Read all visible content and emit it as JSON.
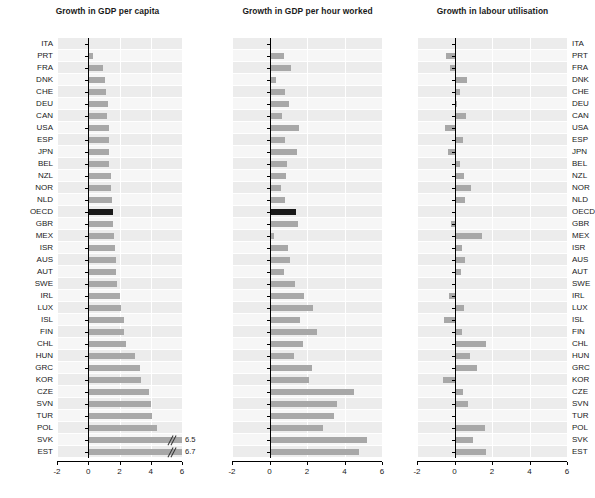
{
  "figure": {
    "width": 585,
    "height": 498,
    "bar_color": "#a8a8a8",
    "highlight_color": "#1a1a1a",
    "plot_bg": "#f2f2f2",
    "grid_color": "#ffffff",
    "highlight_category": "OECD"
  },
  "categories": [
    "ITA",
    "PRT",
    "FRA",
    "DNK",
    "CHE",
    "DEU",
    "CAN",
    "USA",
    "ESP",
    "JPN",
    "BEL",
    "NZL",
    "NOR",
    "NLD",
    "OECD",
    "GBR",
    "MEX",
    "ISR",
    "AUS",
    "AUT",
    "SWE",
    "IRL",
    "LUX",
    "ISL",
    "FIN",
    "CHL",
    "HUN",
    "GRC",
    "KOR",
    "CZE",
    "SVN",
    "TUR",
    "POL",
    "SVK",
    "EST"
  ],
  "chart_data": [
    {
      "type": "bar",
      "title": "Growth in GDP per capita",
      "orientation": "horizontal",
      "xlabel": "",
      "ylabel": "",
      "xlim": [
        -2,
        6
      ],
      "xticks": [
        -2,
        0,
        2,
        4,
        6
      ],
      "xtick_labels": [
        "-2",
        "0",
        "2",
        "4",
        "6"
      ],
      "grid": true,
      "legend": "none",
      "label_side": "left",
      "categories": [
        "ITA",
        "PRT",
        "FRA",
        "DNK",
        "CHE",
        "DEU",
        "CAN",
        "USA",
        "ESP",
        "JPN",
        "BEL",
        "NZL",
        "NOR",
        "NLD",
        "OECD",
        "GBR",
        "MEX",
        "ISR",
        "AUS",
        "AUT",
        "SWE",
        "IRL",
        "LUX",
        "ISL",
        "FIN",
        "CHL",
        "HUN",
        "GRC",
        "KOR",
        "CZE",
        "SVN",
        "TUR",
        "POL",
        "SVK",
        "EST"
      ],
      "values": [
        0.05,
        0.3,
        0.95,
        1.05,
        1.15,
        1.25,
        1.2,
        1.35,
        1.3,
        1.35,
        1.3,
        1.45,
        1.45,
        1.55,
        1.6,
        1.6,
        1.65,
        1.7,
        1.75,
        1.8,
        1.85,
        2.05,
        2.1,
        2.3,
        2.3,
        2.4,
        3.0,
        3.3,
        3.4,
        3.9,
        4.0,
        4.1,
        4.4,
        6.5,
        6.7
      ],
      "annotations": [
        {
          "category": "SVK",
          "label": "6.5",
          "clipped": true
        },
        {
          "category": "EST",
          "label": "6.7",
          "clipped": true
        }
      ]
    },
    {
      "type": "bar",
      "title": "Growth in GDP per hour worked",
      "orientation": "horizontal",
      "xlabel": "",
      "ylabel": "",
      "xlim": [
        -2,
        6
      ],
      "xticks": [
        -2,
        0,
        2,
        4,
        6
      ],
      "xtick_labels": [
        "-2",
        "0",
        "2",
        "4",
        "6"
      ],
      "grid": true,
      "legend": "none",
      "label_side": "none",
      "categories": [
        "ITA",
        "PRT",
        "FRA",
        "DNK",
        "CHE",
        "DEU",
        "CAN",
        "USA",
        "ESP",
        "JPN",
        "BEL",
        "NZL",
        "NOR",
        "NLD",
        "OECD",
        "GBR",
        "MEX",
        "ISR",
        "AUS",
        "AUT",
        "SWE",
        "IRL",
        "LUX",
        "ISL",
        "FIN",
        "CHL",
        "HUN",
        "GRC",
        "KOR",
        "CZE",
        "SVN",
        "TUR",
        "POL",
        "SVK",
        "EST"
      ],
      "values": [
        0.05,
        0.75,
        1.15,
        0.35,
        0.8,
        1.05,
        0.65,
        1.55,
        0.85,
        1.45,
        0.95,
        0.9,
        0.6,
        0.85,
        1.4,
        1.5,
        0.25,
        1.0,
        1.1,
        0.75,
        1.35,
        1.85,
        2.3,
        1.6,
        2.55,
        1.8,
        1.3,
        2.25,
        2.1,
        4.5,
        3.6,
        3.45,
        2.85,
        5.2,
        4.75
      ],
      "annotations": []
    },
    {
      "type": "bar",
      "title": "Growth in labour utilisation",
      "orientation": "horizontal",
      "xlabel": "",
      "ylabel": "",
      "xlim": [
        -2,
        6
      ],
      "xticks": [
        -2,
        0,
        2,
        4,
        6
      ],
      "xtick_labels": [
        "-2",
        "0",
        "2",
        "4",
        "6"
      ],
      "grid": true,
      "legend": "none",
      "label_side": "right",
      "categories": [
        "ITA",
        "PRT",
        "FRA",
        "DNK",
        "CHE",
        "DEU",
        "CAN",
        "USA",
        "ESP",
        "JPN",
        "BEL",
        "NZL",
        "NOR",
        "NLD",
        "OECD",
        "GBR",
        "MEX",
        "ISR",
        "AUS",
        "AUT",
        "SWE",
        "IRL",
        "LUX",
        "ISL",
        "FIN",
        "CHL",
        "HUN",
        "GRC",
        "KOR",
        "CZE",
        "SVN",
        "TUR",
        "POL",
        "SVK",
        "EST"
      ],
      "values": [
        0.0,
        -0.45,
        -0.25,
        0.65,
        0.3,
        0.15,
        0.6,
        -0.5,
        0.45,
        -0.35,
        0.3,
        0.5,
        0.9,
        0.55,
        0.1,
        -0.2,
        1.45,
        0.4,
        0.55,
        0.35,
        0.05,
        -0.3,
        0.5,
        -0.55,
        0.4,
        1.7,
        0.85,
        1.2,
        -0.6,
        0.45,
        0.7,
        0.0,
        1.65,
        1.0,
        1.7
      ],
      "annotations": []
    }
  ]
}
